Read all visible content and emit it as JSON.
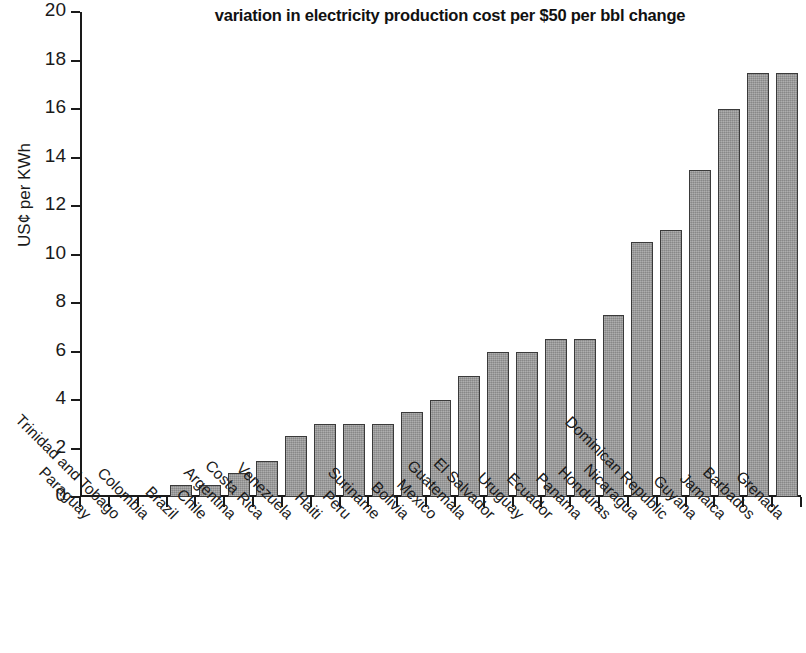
{
  "chart_data": {
    "type": "bar",
    "title": "variation in electricity production cost per $50 per bbl change",
    "xlabel": "",
    "ylabel": "US¢ per KWh",
    "ylim": [
      0,
      20
    ],
    "ytick_values": [
      0,
      2,
      4,
      6,
      8,
      10,
      12,
      14,
      16,
      18,
      20
    ],
    "ytick_labels": [
      "0",
      "2",
      "4",
      "6",
      "8",
      "10",
      "12",
      "14",
      "16",
      "18",
      "20"
    ],
    "grid": false,
    "legend": "none",
    "bar_color": "#9b9b9b",
    "bar_edge_color": "#3a3a3a",
    "categories": [
      "Paraguay",
      "Trinidad and Tobago",
      "Colombia",
      "Brazil",
      "Chile",
      "Argentina",
      "Costa Rica",
      "Venezuela",
      "Haiti",
      "Peru",
      "Suriname",
      "Bolivia",
      "Mexico",
      "Guatemala",
      "El Salvador",
      "Uruguay",
      "Ecuador",
      "Panama",
      "Honduras",
      "Nicaragua",
      "Dominican Republic",
      "Guyana",
      "Jamaica",
      "Barbados",
      "Grenada"
    ],
    "values": [
      0,
      0,
      0,
      0.5,
      0.5,
      1.0,
      1.5,
      2.5,
      3.0,
      3.0,
      3.0,
      3.5,
      4.0,
      5.0,
      6.0,
      6.0,
      6.5,
      6.5,
      7.5,
      10.5,
      11.0,
      13.5,
      16.0,
      17.5,
      17.5
    ]
  }
}
